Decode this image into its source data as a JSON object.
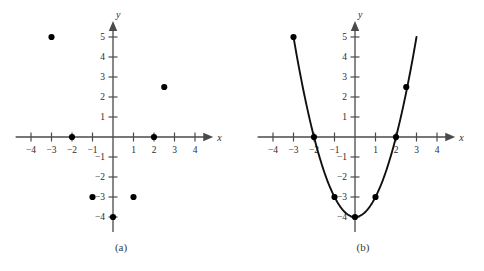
{
  "figure": {
    "panels": [
      {
        "id": "a",
        "caption": "(a)",
        "xlabel": "x",
        "ylabel": "y"
      },
      {
        "id": "b",
        "caption": "(b)",
        "xlabel": "x",
        "ylabel": "y"
      }
    ]
  },
  "axis_labels": {
    "x_ticks": [
      "-4",
      "-3",
      "-2",
      "-1",
      "1",
      "2",
      "3",
      "4"
    ],
    "y_ticks": [
      "5",
      "4",
      "3",
      "2",
      "1",
      "-1",
      "-2",
      "-3",
      "-4"
    ],
    "x_name": "x",
    "y_name": "y"
  },
  "colors": {
    "background": "#ffffff",
    "axis": "#4a4a4a",
    "point": "#000000",
    "curve": "#101010",
    "text": "#2b2b2b"
  },
  "chart_data": [
    {
      "type": "scatter",
      "title": "(a)",
      "xlabel": "x",
      "ylabel": "y",
      "xlim": [
        -4.8,
        4.8
      ],
      "ylim": [
        -4.8,
        5.8
      ],
      "grid": false,
      "legend": "none",
      "x_ticks": [
        -4,
        -3,
        -2,
        -1,
        1,
        2,
        3,
        4
      ],
      "y_ticks": [
        5,
        4,
        3,
        2,
        1,
        -1,
        -2,
        -3,
        -4
      ],
      "points": [
        {
          "x": -3,
          "y": 5
        },
        {
          "x": -2,
          "y": 0
        },
        {
          "x": -1,
          "y": -3
        },
        {
          "x": 0,
          "y": -4
        },
        {
          "x": 1,
          "y": -3
        },
        {
          "x": 2,
          "y": 0
        },
        {
          "x": 2.5,
          "y": 2.5
        }
      ]
    },
    {
      "type": "line",
      "title": "(b)",
      "xlabel": "x",
      "ylabel": "y",
      "xlim": [
        -4.8,
        4.8
      ],
      "ylim": [
        -4.8,
        5.8
      ],
      "grid": false,
      "legend": "none",
      "x_ticks": [
        -4,
        -3,
        -2,
        -1,
        1,
        2,
        3,
        4
      ],
      "y_ticks": [
        5,
        4,
        3,
        2,
        1,
        -1,
        -2,
        -3,
        -4
      ],
      "curve_equation": "y = x^2 - 4",
      "curve_x_range": [
        -3.0,
        3.0
      ],
      "points": [
        {
          "x": -3,
          "y": 5
        },
        {
          "x": -2,
          "y": 0
        },
        {
          "x": -1,
          "y": -3
        },
        {
          "x": 0,
          "y": -4
        },
        {
          "x": 1,
          "y": -3
        },
        {
          "x": 2,
          "y": 0
        },
        {
          "x": 2.5,
          "y": 2.5
        }
      ]
    }
  ]
}
